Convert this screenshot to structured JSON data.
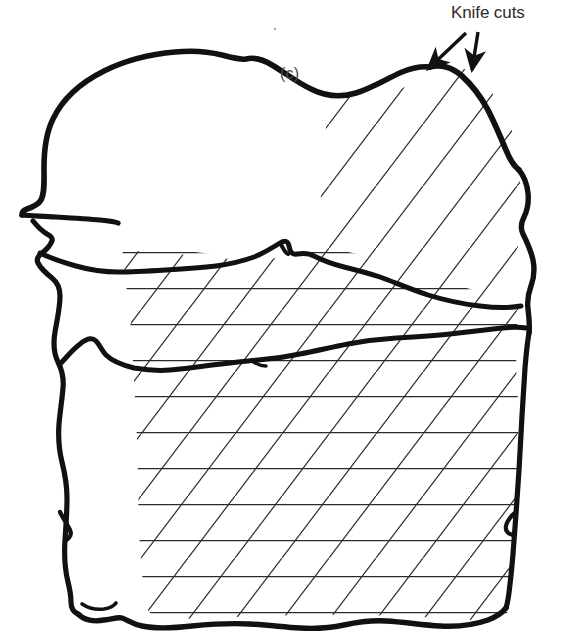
{
  "figure": {
    "panel_label": "(c)",
    "annotation": {
      "label": "Knife cuts",
      "arrow_count": 2,
      "arrow_names": [
        "knife-cut-arrow-left",
        "knife-cut-arrow-right"
      ]
    },
    "colors": {
      "background": "#ffffff",
      "outline": "#111111",
      "hatching": "#2a2a2a",
      "panel_label_text": "#4a4a4a",
      "annotation_text": "#2b2b2b"
    },
    "regions": [
      {
        "name": "upper-unhatched-cortex",
        "fill": "none",
        "hatch": "none"
      },
      {
        "name": "upper-diagonal-hatched-zone",
        "fill": "none",
        "hatch": "diagonal"
      },
      {
        "name": "middle-band",
        "fill": "none",
        "hatch": "cross"
      },
      {
        "name": "lower-cross-hatched-zone",
        "fill": "none",
        "hatch": "cross"
      }
    ],
    "internal_boundaries": [
      {
        "name": "upper-fracture-line"
      },
      {
        "name": "lower-fracture-line"
      }
    ],
    "hatching": {
      "diagonal_angle_deg": 53,
      "diagonal_spacing_px": 47,
      "horizontal_spacing_px": 36,
      "stroke_width_px": 1.2
    },
    "outline_stroke_width_px": 5
  }
}
